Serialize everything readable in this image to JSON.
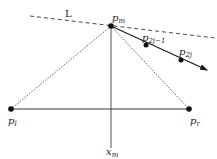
{
  "diagram": {
    "labels": {
      "line": "L",
      "pm": "p",
      "pm_sub": "m",
      "p2j1": "p",
      "p2j1_sub": "2j−1",
      "p2j": "p",
      "p2j_sub": "2j",
      "pl": "p",
      "pl_sub": "l",
      "pr": "p",
      "pr_sub": "r",
      "xm": "x",
      "xm_sub": "m"
    },
    "points": [
      {
        "name": "p_m",
        "x": 111,
        "y": 26
      },
      {
        "name": "p_2j-1",
        "x": 146,
        "y": 45
      },
      {
        "name": "p_2j",
        "x": 181,
        "y": 60
      },
      {
        "name": "p_l",
        "x": 11,
        "y": 109
      },
      {
        "name": "p_r",
        "x": 189,
        "y": 109
      }
    ],
    "edges": [
      {
        "from": "L-start",
        "to": "L-end",
        "style": "dashed"
      },
      {
        "from": "p_m",
        "to": "arrow-end",
        "style": "solid-arrow"
      },
      {
        "from": "p_m",
        "to": "p_l",
        "style": "dotted"
      },
      {
        "from": "p_m",
        "to": "p_r",
        "style": "dotted"
      },
      {
        "from": "p_l",
        "to": "p_r",
        "style": "solid"
      },
      {
        "from": "p_m",
        "to": "x_m",
        "style": "solid"
      }
    ],
    "colors": {
      "ink": "#1a1a1a",
      "line": "#333333",
      "background": "#ffffff"
    }
  }
}
